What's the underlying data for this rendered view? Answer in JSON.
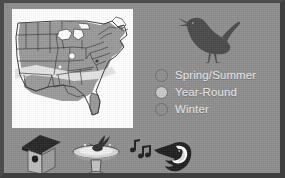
{
  "poster": {
    "background_color": "#8e8e8e",
    "border_color": "#444444",
    "title_hidden": ""
  },
  "map": {
    "name": "range-map-united-states",
    "panel_color": "#ffffff",
    "region": "Eastern and Central United States",
    "range_fill_color": "#9a9a9a",
    "band_fill_color": "#e2e2e2",
    "outline_color": "#3b3b3b",
    "caption": ""
  },
  "bird_illustration": {
    "name": "wren-silhouette",
    "color": "#4a4a4a",
    "caption": ""
  },
  "legend": {
    "name": "range-legend",
    "items": [
      {
        "label": "Spring/Summer",
        "color": "#8f8f8f",
        "outline": "#6d6d6d"
      },
      {
        "label": "Year-Round",
        "color": "#c9c9c9",
        "outline": "#6d6d6d"
      },
      {
        "label": "Winter",
        "color": "#8f8f8f",
        "outline": "#6d6d6d"
      }
    ]
  },
  "icons": [
    {
      "name": "birdhouse-icon",
      "label": "Birdhouse",
      "color": "#2d2d2d"
    },
    {
      "name": "birdbath-icon",
      "label": "Birdbath",
      "color": "#2f2f2f"
    },
    {
      "name": "bird-song-icon",
      "label": "Singing bird with music notes",
      "color": "#1f1f1f"
    }
  ]
}
